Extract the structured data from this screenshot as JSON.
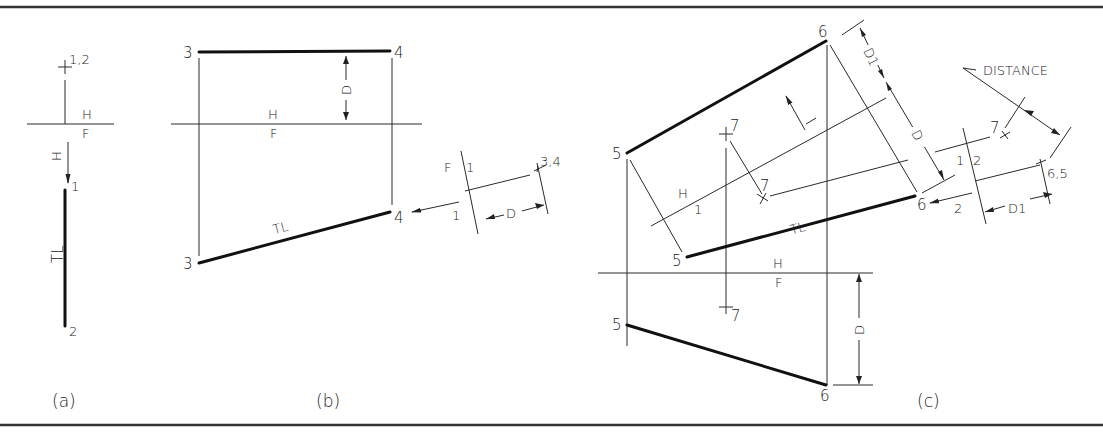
{
  "figure": {
    "panels": [
      {
        "id": "a",
        "caption": "(a)",
        "labels": {
          "point_top": "1,2",
          "fold_h": "H",
          "fold_f": "F",
          "arrow_label": "H",
          "point_1": "1",
          "true_length": "TL",
          "point_2": "2"
        }
      },
      {
        "id": "b",
        "caption": "(b)",
        "labels": {
          "point_3_top": "3",
          "point_4_top": "4",
          "dim_d": "D",
          "fold_h": "H",
          "fold_f": "F",
          "true_length": "TL",
          "point_3_front": "3",
          "point_4_front": "4",
          "aux_fold_f": "F",
          "aux_fold_1_top": "1",
          "aux_fold_1_bottom": "1",
          "point_34": "3,4",
          "aux_dim_d": "D"
        }
      },
      {
        "id": "c",
        "caption": "(c)",
        "labels": {
          "point_6_top": "6",
          "point_5_top": "5",
          "point_7_top": "7",
          "point_7_aux": "7",
          "dim_d1": "D1",
          "dim_d": "D",
          "fold_h1_h": "H",
          "fold_h1_1": "1",
          "true_length": "TL",
          "point_5_aux": "5",
          "point_6_aux": "6",
          "fold_h": "H",
          "fold_f": "F",
          "point_7_front": "7",
          "point_5_front": "5",
          "point_6_front": "6",
          "front_dim_d": "D",
          "distance_note": "DISTANCE",
          "fold_12_1": "1",
          "fold_12_2": "2",
          "point_7_aux2": "7",
          "point_65": "6,5",
          "arrow_2": "2",
          "aux_dim_d1": "D1"
        }
      }
    ]
  }
}
